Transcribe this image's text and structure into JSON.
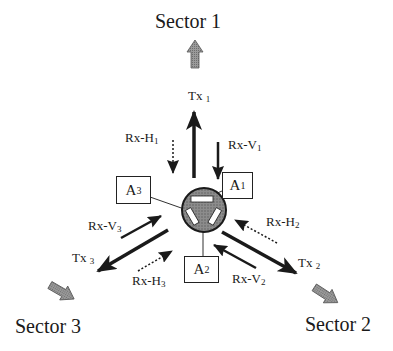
{
  "diagram": {
    "type": "three-sector antenna system schematic",
    "center": {
      "label": "",
      "description": "circular hub with three antenna elements (shaded)"
    },
    "sectors": [
      {
        "id": "sector-1",
        "label": "Sector 1"
      },
      {
        "id": "sector-2",
        "label": "Sector 2"
      },
      {
        "id": "sector-3",
        "label": "Sector 3"
      }
    ],
    "antennas": [
      {
        "id": "A1",
        "base": "A",
        "sub": "1"
      },
      {
        "id": "A2",
        "base": "A",
        "sub": "2"
      },
      {
        "id": "A3",
        "base": "A",
        "sub": "3"
      }
    ],
    "signals": {
      "tx1": {
        "base": "Tx ",
        "sub": "1",
        "style": "solid",
        "direction": "outward"
      },
      "tx2": {
        "base": "Tx ",
        "sub": "2",
        "style": "solid",
        "direction": "outward"
      },
      "tx3": {
        "base": "Tx ",
        "sub": "3",
        "style": "solid",
        "direction": "outward"
      },
      "rxv1": {
        "base": "Rx-V",
        "sub": "1",
        "style": "solid",
        "direction": "inward"
      },
      "rxv2": {
        "base": "Rx-V",
        "sub": "2",
        "style": "solid",
        "direction": "inward"
      },
      "rxv3": {
        "base": "Rx-V",
        "sub": "3",
        "style": "solid",
        "direction": "inward"
      },
      "rxh1": {
        "base": "Rx-H",
        "sub": "1",
        "style": "dotted",
        "direction": "inward"
      },
      "rxh2": {
        "base": "Rx-H",
        "sub": "2",
        "style": "dotted",
        "direction": "inward"
      },
      "rxh3": {
        "base": "Rx-H",
        "sub": "3",
        "style": "dotted",
        "direction": "inward"
      }
    },
    "colors": {
      "ink": "#1a1a1a",
      "sector_arrow": "#8a8a8a",
      "hub_fill": "#7a7a7a",
      "background": "#ffffff"
    }
  }
}
